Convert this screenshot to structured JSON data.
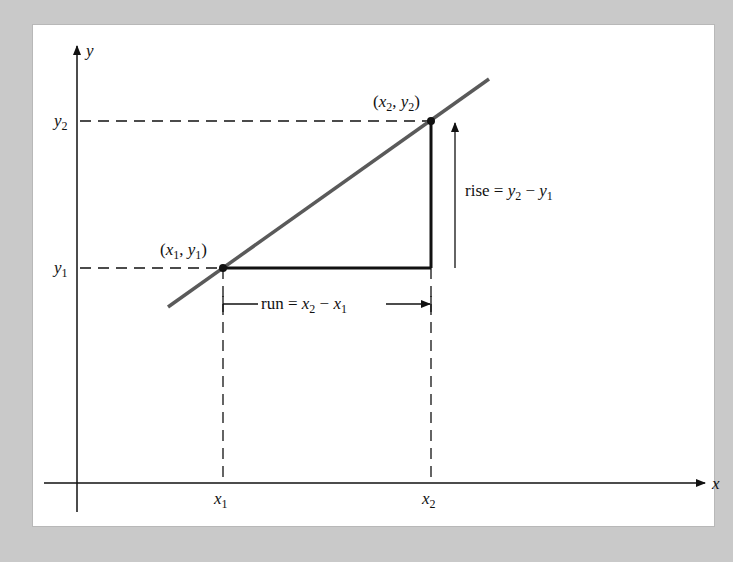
{
  "diagram": {
    "axes": {
      "x_label": "x",
      "y_label": "y"
    },
    "points": {
      "p1": {
        "label_open": "(",
        "x": "x",
        "x_sub": "1",
        "comma": ", ",
        "y": "y",
        "y_sub": "1",
        "label_close": ")"
      },
      "p2": {
        "label_open": "(",
        "x": "x",
        "x_sub": "2",
        "comma": ", ",
        "y": "y",
        "y_sub": "2",
        "label_close": ")"
      }
    },
    "ticks": {
      "x1": {
        "base": "x",
        "sub": "1"
      },
      "x2": {
        "base": "x",
        "sub": "2"
      },
      "y1": {
        "base": "y",
        "sub": "1"
      },
      "y2": {
        "base": "y",
        "sub": "2"
      }
    },
    "rise": {
      "word": "rise",
      "eq": " = ",
      "a": "y",
      "a_sub": "2",
      "minus": " − ",
      "b": "y",
      "b_sub": "1"
    },
    "run": {
      "word": "run",
      "eq": " = ",
      "a": "x",
      "a_sub": "2",
      "minus": " − ",
      "b": "x",
      "b_sub": "1"
    },
    "colors": {
      "line": "#5a5a5a",
      "ink": "#111111",
      "background": "#c9c9c9",
      "panel": "#ffffff"
    }
  }
}
